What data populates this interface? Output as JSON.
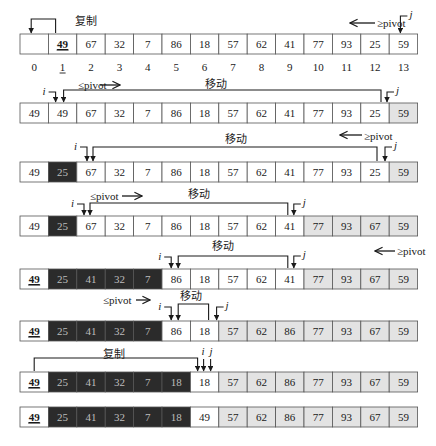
{
  "diagram": {
    "pivot_value": "49",
    "labels": {
      "copy": "复制",
      "move": "移动",
      "le_pivot": "≤pivot",
      "ge_pivot": "≥pivot",
      "i": "i",
      "j": "j"
    },
    "colors": {
      "white_cell": "#ffffff",
      "dark_cell": "#2b2b2b",
      "light_cell": "#e3e3e3",
      "border": "#555555",
      "ink": "#1a1a1a"
    },
    "indices": [
      "0",
      "1",
      "2",
      "3",
      "4",
      "5",
      "6",
      "7",
      "8",
      "9",
      "10",
      "11",
      "12",
      "13"
    ],
    "rows": [
      {
        "values": [
          "",
          "49",
          "67",
          "32",
          "7",
          "86",
          "18",
          "57",
          "62",
          "41",
          "77",
          "93",
          "25",
          "59"
        ],
        "shades": [
          "w",
          "w",
          "w",
          "w",
          "w",
          "w",
          "w",
          "w",
          "w",
          "w",
          "w",
          "w",
          "w",
          "w"
        ],
        "underline": [
          1
        ]
      },
      {
        "values": [
          "49",
          "49",
          "67",
          "32",
          "7",
          "86",
          "18",
          "57",
          "62",
          "41",
          "77",
          "93",
          "25",
          "59"
        ],
        "shades": [
          "w",
          "w",
          "w",
          "w",
          "w",
          "w",
          "w",
          "w",
          "w",
          "w",
          "w",
          "w",
          "w",
          "l"
        ],
        "underline": []
      },
      {
        "values": [
          "49",
          "25",
          "67",
          "32",
          "7",
          "86",
          "18",
          "57",
          "62",
          "41",
          "77",
          "93",
          "25",
          "59"
        ],
        "shades": [
          "w",
          "d",
          "w",
          "w",
          "w",
          "w",
          "w",
          "w",
          "w",
          "w",
          "w",
          "w",
          "w",
          "l"
        ],
        "underline": []
      },
      {
        "values": [
          "49",
          "25",
          "67",
          "32",
          "7",
          "86",
          "18",
          "57",
          "62",
          "41",
          "77",
          "93",
          "67",
          "59"
        ],
        "shades": [
          "w",
          "d",
          "w",
          "w",
          "w",
          "w",
          "w",
          "w",
          "w",
          "w",
          "l",
          "l",
          "l",
          "l"
        ],
        "underline": []
      },
      {
        "values": [
          "49",
          "25",
          "41",
          "32",
          "7",
          "86",
          "18",
          "57",
          "62",
          "41",
          "77",
          "93",
          "67",
          "59"
        ],
        "shades": [
          "w",
          "d",
          "d",
          "d",
          "d",
          "w",
          "w",
          "w",
          "w",
          "w",
          "l",
          "l",
          "l",
          "l"
        ],
        "underline": [
          0
        ]
      },
      {
        "values": [
          "49",
          "25",
          "41",
          "32",
          "7",
          "86",
          "18",
          "57",
          "62",
          "86",
          "77",
          "93",
          "67",
          "59"
        ],
        "shades": [
          "w",
          "d",
          "d",
          "d",
          "d",
          "w",
          "w",
          "l",
          "l",
          "l",
          "l",
          "l",
          "l",
          "l"
        ],
        "underline": [
          0
        ]
      },
      {
        "values": [
          "49",
          "25",
          "41",
          "32",
          "7",
          "18",
          "18",
          "57",
          "62",
          "86",
          "77",
          "93",
          "67",
          "59"
        ],
        "shades": [
          "w",
          "d",
          "d",
          "d",
          "d",
          "d",
          "w",
          "l",
          "l",
          "l",
          "l",
          "l",
          "l",
          "l"
        ],
        "underline": [
          0
        ]
      },
      {
        "values": [
          "49",
          "25",
          "41",
          "32",
          "7",
          "18",
          "49",
          "57",
          "62",
          "86",
          "77",
          "93",
          "67",
          "59"
        ],
        "shades": [
          "w",
          "d",
          "d",
          "d",
          "d",
          "d",
          "w",
          "l",
          "l",
          "l",
          "l",
          "l",
          "l",
          "l"
        ],
        "underline": [
          0
        ]
      }
    ]
  }
}
